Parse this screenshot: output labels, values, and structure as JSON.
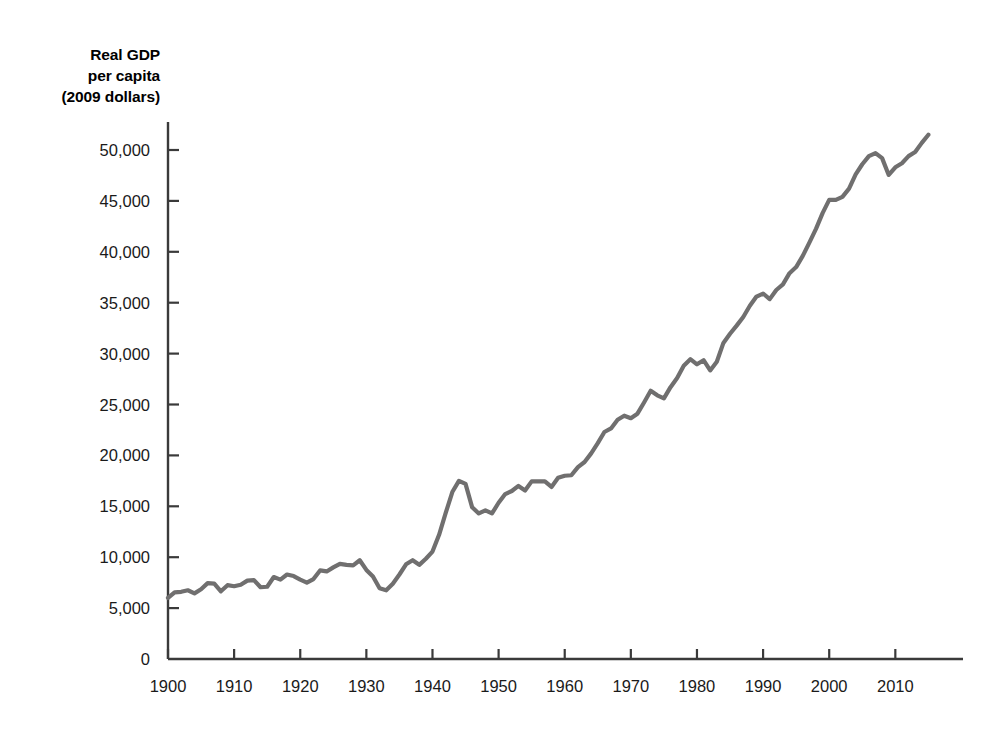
{
  "chart_data": {
    "type": "line",
    "title": "",
    "ylabel": "Real GDP per capita (2009 dollars)",
    "ylabel_lines": [
      "Real GDP",
      "per capita",
      "(2009 dollars)"
    ],
    "xlabel": "",
    "xlim": [
      1900,
      2016
    ],
    "ylim": [
      0,
      50000
    ],
    "grid": false,
    "legend": null,
    "line_color": "#706f6f",
    "axis_color": "#3a3a3a",
    "yticks": [
      0,
      5000,
      10000,
      15000,
      20000,
      25000,
      30000,
      35000,
      40000,
      45000,
      50000
    ],
    "ytick_labels": [
      "0",
      "5,000",
      "10,000",
      "15,000",
      "20,000",
      "25,000",
      "30,000",
      "35,000",
      "40,000",
      "45,000",
      "50,000"
    ],
    "xticks": [
      1900,
      1910,
      1920,
      1930,
      1940,
      1950,
      1960,
      1970,
      1980,
      1990,
      2000,
      2010
    ],
    "xtick_labels": [
      "1900",
      "1910",
      "1920",
      "1930",
      "1940",
      "1950",
      "1960",
      "1970",
      "1980",
      "1990",
      "2000",
      "2010"
    ],
    "series": [
      {
        "name": "Real GDP per capita",
        "x": [
          1900,
          1901,
          1902,
          1903,
          1904,
          1905,
          1906,
          1907,
          1908,
          1909,
          1910,
          1911,
          1912,
          1913,
          1914,
          1915,
          1916,
          1917,
          1918,
          1919,
          1920,
          1921,
          1922,
          1923,
          1924,
          1925,
          1926,
          1927,
          1928,
          1929,
          1930,
          1931,
          1932,
          1933,
          1934,
          1935,
          1936,
          1937,
          1938,
          1939,
          1940,
          1941,
          1942,
          1943,
          1944,
          1945,
          1946,
          1947,
          1948,
          1949,
          1950,
          1951,
          1952,
          1953,
          1954,
          1955,
          1956,
          1957,
          1958,
          1959,
          1960,
          1961,
          1962,
          1963,
          1964,
          1965,
          1966,
          1967,
          1968,
          1969,
          1970,
          1971,
          1972,
          1973,
          1974,
          1975,
          1976,
          1977,
          1978,
          1979,
          1980,
          1981,
          1982,
          1983,
          1984,
          1985,
          1986,
          1987,
          1988,
          1989,
          1990,
          1991,
          1992,
          1993,
          1994,
          1995,
          1996,
          1997,
          1998,
          1999,
          2000,
          2001,
          2002,
          2003,
          2004,
          2005,
          2006,
          2007,
          2008,
          2009,
          2010,
          2011,
          2012,
          2013,
          2014,
          2015
        ],
        "values": [
          6000,
          6550,
          6600,
          6750,
          6450,
          6850,
          7450,
          7400,
          6650,
          7250,
          7150,
          7300,
          7700,
          7750,
          7050,
          7100,
          8050,
          7800,
          8300,
          8150,
          7800,
          7500,
          7850,
          8700,
          8600,
          9000,
          9350,
          9250,
          9200,
          9700,
          8750,
          8100,
          6950,
          6750,
          7400,
          8300,
          9300,
          9700,
          9250,
          9850,
          10550,
          12200,
          14350,
          16400,
          17500,
          17200,
          14900,
          14300,
          14600,
          14300,
          15350,
          16200,
          16500,
          17000,
          16550,
          17450,
          17450,
          17450,
          16900,
          17800,
          18000,
          18050,
          18850,
          19350,
          20200,
          21200,
          22300,
          22650,
          23500,
          23900,
          23650,
          24100,
          25200,
          26350,
          25900,
          25600,
          26700,
          27600,
          28800,
          29450,
          28950,
          29350,
          28350,
          29200,
          31050,
          31950,
          32750,
          33600,
          34700,
          35600,
          35900,
          35350,
          36250,
          36800,
          37900,
          38500,
          39600,
          40900,
          42250,
          43800,
          45100,
          45100,
          45400,
          46200,
          47600,
          48600,
          49400,
          49700,
          49200,
          47550,
          48300,
          48700,
          49400,
          49800,
          50700,
          51500
        ]
      }
    ],
    "annotations": []
  }
}
